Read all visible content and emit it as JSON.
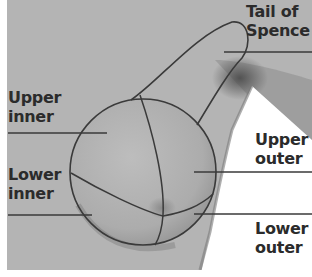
{
  "diagram": {
    "colors": {
      "skin_light": "#b9b9b9",
      "skin_mid": "#a8a8a8",
      "shadow": "#5e5e5e",
      "outline": "#3a3a3a",
      "text": "#2b2b2b",
      "background": "#ffffff"
    },
    "labels": {
      "tail_of_spence": {
        "line1": "Tail of",
        "line2": "Spence"
      },
      "upper_inner": {
        "line1": "Upper",
        "line2": "inner"
      },
      "lower_inner": {
        "line1": "Lower",
        "line2": "inner"
      },
      "upper_outer": {
        "line1": "Upper",
        "line2": "outer"
      },
      "lower_outer": {
        "line1": "Lower",
        "line2": "outer"
      }
    }
  }
}
